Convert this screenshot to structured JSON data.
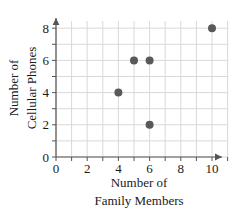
{
  "chart_data": {
    "type": "scatter",
    "title": "",
    "xlabel": "Number of Family Members",
    "xlabel_line1": "Number of",
    "xlabel_line2": "Family Members",
    "ylabel": "Number of Cellular Phones",
    "ylabel_line1": "Number of",
    "ylabel_line2": "Cellular Phones",
    "xlim": [
      0,
      11
    ],
    "ylim": [
      0,
      8.6
    ],
    "xticks": [
      0,
      2,
      4,
      6,
      8,
      10
    ],
    "xtick_labels": [
      "0",
      "2",
      "4",
      "6",
      "8",
      "10"
    ],
    "yticks": [
      0,
      2,
      4,
      6,
      8
    ],
    "ytick_labels": [
      "0",
      "2",
      "4",
      "6",
      "8"
    ],
    "grid": true,
    "grid_step": 1,
    "legend": "none",
    "points": [
      {
        "x": 4,
        "y": 4
      },
      {
        "x": 5,
        "y": 6
      },
      {
        "x": 6,
        "y": 6
      },
      {
        "x": 6,
        "y": 2
      },
      {
        "x": 10,
        "y": 8
      }
    ],
    "colors": {
      "marker": "#595959",
      "grid": "#d9d9d9",
      "axis": "#555555",
      "text": "#1a1a1a",
      "background": "#ffffff"
    },
    "marker_radius": 4
  }
}
